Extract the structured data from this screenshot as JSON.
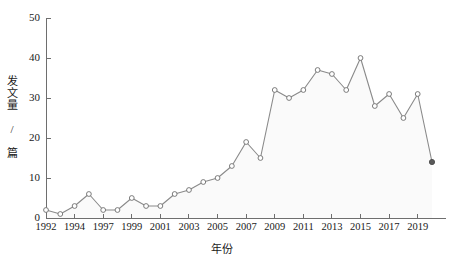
{
  "chart_data": {
    "type": "line",
    "title": "",
    "xlabel": "年份",
    "ylabel": "发文量 / 篇",
    "xlim": [
      1992,
      2020
    ],
    "ylim": [
      0,
      50
    ],
    "yticks": [
      0,
      10,
      20,
      30,
      40,
      50
    ],
    "ytick_labels": [
      "0",
      "10",
      "20",
      "30",
      "40",
      "50"
    ],
    "xtick_labels": [
      "1992",
      "1994",
      "1997",
      "1999",
      "2001",
      "2003",
      "2005",
      "2007",
      "2009",
      "2011",
      "2013",
      "2015",
      "2017",
      "2019"
    ],
    "xticks": [
      1992,
      1994,
      1996,
      1998,
      2000,
      2002,
      2004,
      2006,
      2008,
      2010,
      2012,
      2014,
      2016,
      2018
    ],
    "grid": false,
    "legend": null,
    "marker": "open-circle",
    "last_point_marker": "filled-circle",
    "area_fill": true,
    "line_color": "#8a8a8a",
    "marker_color": "#6e6e6e",
    "fill_color": "#fafafa",
    "x": [
      1992,
      1993,
      1994,
      1995,
      1996,
      1997,
      1998,
      1999,
      2000,
      2001,
      2002,
      2003,
      2004,
      2005,
      2006,
      2007,
      2008,
      2009,
      2010,
      2011,
      2012,
      2013,
      2014,
      2015,
      2016,
      2017,
      2018,
      2019
    ],
    "values": [
      2,
      1,
      3,
      6,
      2,
      2,
      5,
      3,
      3,
      6,
      7,
      9,
      10,
      13,
      19,
      15,
      32,
      30,
      32,
      37,
      36,
      32,
      40,
      28,
      31,
      25,
      31,
      14
    ],
    "series": [
      {
        "name": "发文量",
        "values": [
          2,
          1,
          3,
          6,
          2,
          2,
          5,
          3,
          3,
          6,
          7,
          9,
          10,
          13,
          19,
          15,
          32,
          30,
          32,
          37,
          36,
          32,
          40,
          28,
          31,
          25,
          31,
          14
        ]
      }
    ]
  }
}
